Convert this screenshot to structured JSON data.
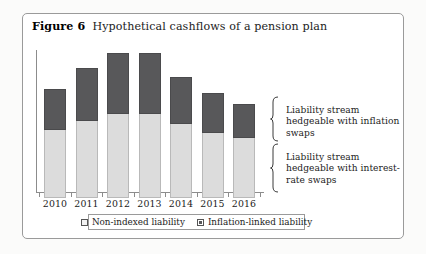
{
  "figure": {
    "number_label": "Figure 6",
    "caption": "Hypothetical cashflows of a pension plan"
  },
  "annotations": {
    "upper": "Liability stream hedgeable with inflation swaps",
    "lower": "Liability stream hedgeable with interest-rate swaps"
  },
  "legend": {
    "items": [
      {
        "label": "Non-indexed liability",
        "swatch": "light",
        "color": "#f2f2f2"
      },
      {
        "label": "Inflation-linked liability",
        "swatch": "dark",
        "color": "#58585a"
      }
    ]
  },
  "chart_data": {
    "type": "bar",
    "stacked": true,
    "title": "Hypothetical cashflows of a pension plan",
    "xlabel": "",
    "ylabel": "",
    "grid": false,
    "legend_position": "bottom",
    "axis": {
      "y_ticks_shown": false,
      "x_ticks_shown": true,
      "ylim": [
        0,
        100
      ]
    },
    "categories": [
      "2010",
      "2011",
      "2012",
      "2013",
      "2014",
      "2015",
      "2016"
    ],
    "series": [
      {
        "name": "Non-indexed liability",
        "color": "#dcdcdc",
        "values": [
          48,
          54,
          59,
          59,
          52,
          46,
          42
        ]
      },
      {
        "name": "Inflation-linked liability",
        "color": "#58585a",
        "values": [
          29,
          37,
          43,
          43,
          33,
          28,
          24
        ]
      }
    ],
    "totals": [
      77,
      91,
      102,
      102,
      85,
      74,
      66
    ]
  }
}
